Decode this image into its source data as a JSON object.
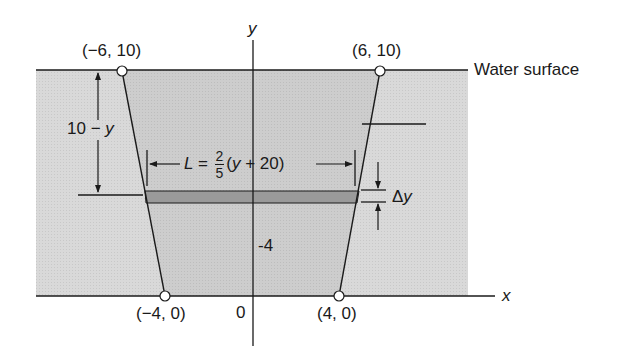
{
  "figure": {
    "type": "trapezoidal dam / water cross-section diagram",
    "colors": {
      "water_outer": "#d9d9d9",
      "water_inner": "#cfcfcf",
      "strip": "#9a9a9a",
      "line": "#1a1a1a",
      "background": "#ffffff"
    }
  },
  "axes": {
    "x_label": "x",
    "y_label": "y",
    "origin_label": "0",
    "tick_label_y": "-4"
  },
  "points": [
    {
      "label": "(−6, 10)",
      "x": -6,
      "y": 10
    },
    {
      "label": "(6, 10)",
      "x": 6,
      "y": 10
    },
    {
      "label": "(−4, 0)",
      "x": -4,
      "y": 0
    },
    {
      "label": "(4, 0)",
      "x": 4,
      "y": 0
    }
  ],
  "annotations": {
    "water_surface": "Water surface",
    "depth_label_num": "10",
    "depth_label_op": " − ",
    "depth_label_var": "y",
    "length_prefix": "L = ",
    "length_frac_num": "2",
    "length_frac_den": "5",
    "length_suffix_open": "(",
    "length_suffix_var": "y",
    "length_suffix_rest": " + 20)",
    "strip_thickness": "Δ",
    "strip_thickness_var": "y"
  }
}
